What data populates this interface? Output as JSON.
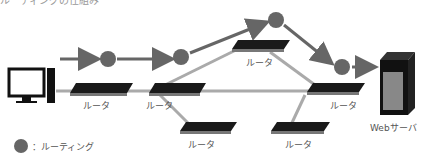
{
  "heading_cropped": "ルーティングの仕組み",
  "labels": {
    "router": "ルータ",
    "server": "Webサーバ",
    "legend": "：ルーティング"
  },
  "colors": {
    "route_dot": "#666666",
    "arrow": "#666666",
    "link": "#aaaaaa",
    "router_body": "#1a1a1a"
  }
}
